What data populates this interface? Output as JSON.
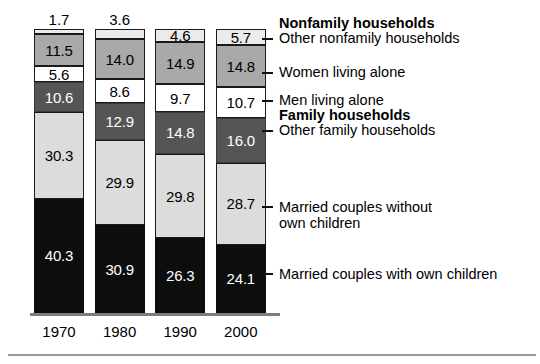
{
  "chart_data": {
    "type": "bar",
    "title": "",
    "subtitle": "",
    "xlabel": "",
    "ylabel": "",
    "stacked": true,
    "units": "percent",
    "ylim": [
      0,
      100
    ],
    "grid": false,
    "legend_position": "right-callouts",
    "categories": [
      "1970",
      "1980",
      "1990",
      "2000"
    ],
    "series": [
      {
        "name": "Other nonfamily households",
        "group": "Nonfamily households",
        "color": "#ebebeb",
        "swatch": "vlightgray",
        "values": [
          1.7,
          3.6,
          4.6,
          5.7
        ],
        "labels": [
          "1.7",
          "3.6",
          "4.6",
          "5.7"
        ]
      },
      {
        "name": "Women living alone",
        "group": "Nonfamily households",
        "color": "#a9a9a9",
        "swatch": "medgray",
        "values": [
          11.5,
          14.0,
          14.9,
          14.8
        ],
        "labels": [
          "11.5",
          "14.0",
          "14.9",
          "14.8"
        ]
      },
      {
        "name": "Men living alone",
        "group": "Nonfamily households",
        "color": "#ffffff",
        "swatch": "white",
        "values": [
          5.6,
          8.6,
          9.7,
          10.7
        ],
        "labels": [
          "5.6",
          "8.6",
          "9.7",
          "10.7"
        ]
      },
      {
        "name": "Other family households",
        "group": "Family households",
        "color": "#555555",
        "swatch": "darkgray",
        "values": [
          10.6,
          12.9,
          14.8,
          16.0
        ],
        "labels": [
          "10.6",
          "12.9",
          "14.8",
          "16.0"
        ]
      },
      {
        "name": "Married couples without own children",
        "group": "Family households",
        "color": "#dcdcdc",
        "swatch": "lightgray",
        "values": [
          30.3,
          29.9,
          29.8,
          28.7
        ],
        "labels": [
          "30.3",
          "29.9",
          "29.8",
          "28.7"
        ]
      },
      {
        "name": "Married couples with own children",
        "group": "Family households",
        "color": "#0d0d0d",
        "swatch": "dark",
        "values": [
          40.3,
          30.9,
          26.3,
          24.1
        ],
        "labels": [
          "40.3",
          "30.9",
          "26.3",
          "24.1"
        ]
      }
    ],
    "annotations": [
      {
        "text": "Nonfamily households",
        "bold": true,
        "has_tick": false
      },
      {
        "text": "Other nonfamily households",
        "bold": false,
        "has_tick": true
      },
      {
        "text": "Women living alone",
        "bold": false,
        "has_tick": true
      },
      {
        "text": "Men living alone",
        "bold": false,
        "has_tick": true
      },
      {
        "text": "Family households",
        "bold": true,
        "has_tick": false
      },
      {
        "text": "Other family households",
        "bold": false,
        "has_tick": true
      },
      {
        "text": "Married couples without\nown children",
        "bold": false,
        "has_tick": true
      },
      {
        "text": "Married couples with own children",
        "bold": false,
        "has_tick": true
      }
    ]
  },
  "axis": {
    "tick_labels": [
      "1970",
      "1980",
      "1990",
      "2000"
    ]
  },
  "bars": [
    {
      "year": "1970",
      "top_label": "1.7",
      "segments": [
        {
          "label": "1.7",
          "swatch": "vlightgray",
          "inside": false
        },
        {
          "label": "11.5",
          "swatch": "medgray",
          "inside": true
        },
        {
          "label": "5.6",
          "swatch": "white",
          "inside": true
        },
        {
          "label": "10.6",
          "swatch": "darkgray",
          "inside": true
        },
        {
          "label": "30.3",
          "swatch": "lightgray",
          "inside": true
        },
        {
          "label": "40.3",
          "swatch": "dark",
          "inside": true
        }
      ]
    },
    {
      "year": "1980",
      "top_label": "3.6",
      "segments": [
        {
          "label": "3.6",
          "swatch": "vlightgray",
          "inside": false
        },
        {
          "label": "14.0",
          "swatch": "medgray",
          "inside": true
        },
        {
          "label": "8.6",
          "swatch": "white",
          "inside": true
        },
        {
          "label": "12.9",
          "swatch": "darkgray",
          "inside": true
        },
        {
          "label": "29.9",
          "swatch": "lightgray",
          "inside": true
        },
        {
          "label": "30.9",
          "swatch": "dark",
          "inside": true
        }
      ]
    },
    {
      "year": "1990",
      "top_label": "",
      "segments": [
        {
          "label": "4.6",
          "swatch": "vlightgray",
          "inside": true
        },
        {
          "label": "14.9",
          "swatch": "medgray",
          "inside": true
        },
        {
          "label": "9.7",
          "swatch": "white",
          "inside": true
        },
        {
          "label": "14.8",
          "swatch": "darkgray",
          "inside": true
        },
        {
          "label": "29.8",
          "swatch": "lightgray",
          "inside": true
        },
        {
          "label": "26.3",
          "swatch": "dark",
          "inside": true
        }
      ]
    },
    {
      "year": "2000",
      "top_label": "",
      "segments": [
        {
          "label": "5.7",
          "swatch": "vlightgray",
          "inside": true
        },
        {
          "label": "14.8",
          "swatch": "medgray",
          "inside": true
        },
        {
          "label": "10.7",
          "swatch": "white",
          "inside": true
        },
        {
          "label": "16.0",
          "swatch": "darkgray",
          "inside": true
        },
        {
          "label": "28.7",
          "swatch": "lightgray",
          "inside": true
        },
        {
          "label": "24.1",
          "swatch": "dark",
          "inside": true
        }
      ]
    }
  ],
  "callouts": [
    {
      "text": "Nonfamily households",
      "bold": true
    },
    {
      "text": "Other nonfamily households",
      "bold": false
    },
    {
      "text": "Women living alone",
      "bold": false
    },
    {
      "text": "Men living alone",
      "bold": false
    },
    {
      "text": "Family households",
      "bold": true
    },
    {
      "text": "Other family households",
      "bold": false
    },
    {
      "text": "Married couples without\nown children",
      "bold": false
    },
    {
      "text": "Married couples with own children",
      "bold": false
    }
  ],
  "colors": {
    "other_nonfamily": "#ebebeb",
    "women_alone": "#a9a9a9",
    "men_alone": "#ffffff",
    "other_family": "#555555",
    "married_no_children": "#dcdcdc",
    "married_with_children": "#0d0d0d",
    "outline": "#1a1a1a",
    "axis": "#7d7d7d"
  }
}
